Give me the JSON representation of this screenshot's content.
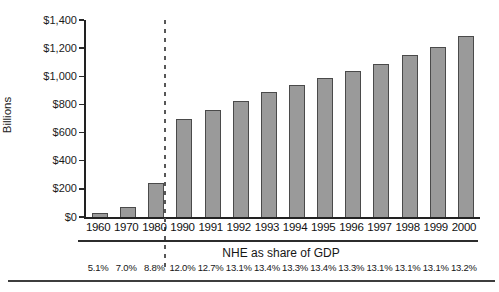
{
  "chart_data": {
    "type": "bar",
    "title": "",
    "ylabel": "Billions",
    "footnote_label": "NHE as share of GDP",
    "categories": [
      "1960",
      "1970",
      "1980",
      "1990",
      "1991",
      "1992",
      "1993",
      "1994",
      "1995",
      "1996",
      "1997",
      "1998",
      "1999",
      "2000"
    ],
    "values": [
      27,
      73,
      245,
      695,
      760,
      825,
      885,
      935,
      990,
      1040,
      1090,
      1150,
      1210,
      1285
    ],
    "gdp_share": [
      "5.1%",
      "7.0%",
      "8.8%",
      "12.0%",
      "12.7%",
      "13.1%",
      "13.4%",
      "13.3%",
      "13.4%",
      "13.3%",
      "13.1%",
      "13.1%",
      "13.1%",
      "13.2%"
    ],
    "ylim": [
      0,
      1400
    ],
    "ytick_values": [
      0,
      200,
      400,
      600,
      800,
      1000,
      1200,
      1400
    ],
    "ytick_labels": [
      "$0",
      "$200",
      "$400",
      "$600",
      "$800",
      "$1,000",
      "$1,200",
      "$1,400"
    ],
    "divider_after_category": "1980",
    "grid": "off",
    "legend": "none",
    "bar_color": "#9a9a9a",
    "bar_border_color": "#4a4a4a"
  }
}
